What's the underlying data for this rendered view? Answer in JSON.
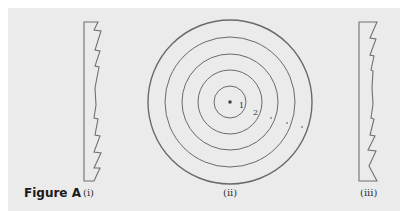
{
  "figure": {
    "label": "Figure A",
    "panels": [
      {
        "id": "i",
        "caption": "(i)",
        "description": "Fresnel lens cross-section, sawtooth facing right"
      },
      {
        "id": "ii",
        "caption": "(ii)",
        "description": "Front view: concentric circular zones"
      },
      {
        "id": "iii",
        "caption": "(iii)",
        "description": "Fresnel lens cross-section, sawtooth facing right"
      }
    ],
    "zone_labels": [
      "1",
      "2",
      ".",
      ".",
      "."
    ]
  },
  "colors": {
    "background": "#ebebeb",
    "stroke": "#6a6a6a"
  }
}
